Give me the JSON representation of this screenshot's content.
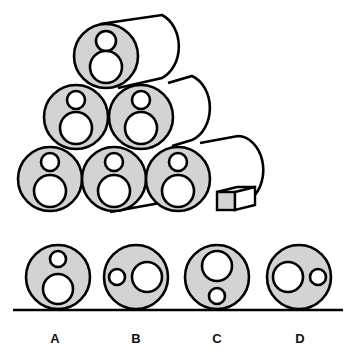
{
  "puzzle": {
    "description": "Stack of six cylinders viewed from the end; each end shows a small circle above a large circle",
    "colors": {
      "end_fill": "#d3d3d3",
      "stroke": "#000000",
      "hole_fill": "#ffffff",
      "block_front": "#d3d3d3"
    }
  },
  "options": [
    {
      "label": "A",
      "layout": "small-top-large-bottom"
    },
    {
      "label": "B",
      "layout": "small-left-large-right"
    },
    {
      "label": "C",
      "layout": "large-top-small-bottom"
    },
    {
      "label": "D",
      "layout": "large-left-small-right"
    }
  ]
}
